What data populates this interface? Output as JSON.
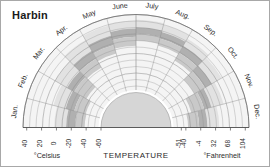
{
  "figure": {
    "title": "Harbin",
    "background": "#ffffff",
    "border_color": "#a8a8a8"
  },
  "axis": {
    "title": "TEMPERATURE",
    "celsius_unit": "°Celsius",
    "fahrenheit_unit": "°Fahrenheit",
    "celsius_ticks": [
      "40",
      "20",
      "0",
      "-20",
      "-40",
      "-60"
    ],
    "fahrenheit_ticks": [
      "-51",
      "-40",
      "-4",
      "32",
      "68",
      "104"
    ]
  },
  "months": [
    "Jan.",
    "Feb.",
    "Mar.",
    "Apr.",
    "May",
    "June",
    "July",
    "Aug.",
    "Sep.",
    "Oct.",
    "Nov.",
    "Dec."
  ],
  "colors": {
    "grid": "#8d8d8d",
    "band_dark": "#b0b0b0",
    "band_mid": "#c9c9c9",
    "band_light": "#e2e2e2",
    "plot_bg": "#f4f4f4",
    "hub": "#d6d6d6",
    "hub_ring": "#ffffff",
    "text": "#2b2b2b"
  },
  "chart_data": {
    "type": "area",
    "title": "Harbin",
    "xlabel": "",
    "ylabel": "TEMPERATURE",
    "projection": "semi-polar",
    "grid": true,
    "legend": false,
    "radial_axis": {
      "label_left": "°Celsius",
      "label_right": "°Fahrenheit",
      "celsius_ticks": [
        40,
        20,
        0,
        -20,
        -40,
        -60
      ],
      "fahrenheit_ticks": [
        104,
        68,
        32,
        -4,
        -40,
        -51
      ],
      "direction": "outward = warmer",
      "celsius_range": [
        -60,
        45
      ],
      "rings": 12
    },
    "angular_axis": {
      "categories": [
        "Jan.",
        "Feb.",
        "Mar.",
        "Apr.",
        "May",
        "June",
        "July",
        "Aug.",
        "Sep.",
        "Oct.",
        "Nov.",
        "Dec."
      ],
      "start_angle_deg": 180,
      "end_angle_deg": 0
    },
    "series": [
      {
        "name": "Record high (°C)",
        "values": [
          3,
          8,
          19,
          29,
          35,
          37,
          38,
          36,
          31,
          26,
          15,
          5
        ]
      },
      {
        "name": "Average high (°C)",
        "values": [
          -13,
          -9,
          0,
          12,
          21,
          26,
          28,
          26,
          20,
          11,
          -2,
          -11
        ]
      },
      {
        "name": "Average low (°C)",
        "values": [
          -25,
          -21,
          -11,
          0,
          8,
          15,
          19,
          17,
          9,
          0,
          -12,
          -22
        ]
      },
      {
        "name": "Record low (°C)",
        "values": [
          -38,
          -37,
          -30,
          -14,
          -4,
          3,
          10,
          7,
          -3,
          -16,
          -30,
          -37
        ]
      }
    ]
  }
}
